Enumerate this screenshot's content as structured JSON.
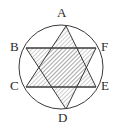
{
  "figure": {
    "background_color": "#ffffff",
    "stroke_color": "#3a3a3a",
    "hatch_color": "#8c8c8c",
    "label_color": "#2b2b2b",
    "circle": {
      "cx": 61,
      "cy": 67,
      "r": 42
    },
    "vertices": [
      {
        "id": "A",
        "label": "A",
        "x": 66,
        "y": 26,
        "label_x": 57,
        "label_y": 8,
        "position": "top"
      },
      {
        "id": "B",
        "label": "B",
        "x": 26,
        "y": 48,
        "label_x": 10,
        "label_y": 40,
        "position": "upper-left"
      },
      {
        "id": "F",
        "label": "F",
        "x": 96,
        "y": 48,
        "label_x": 101,
        "label_y": 40,
        "position": "upper-right"
      },
      {
        "id": "C",
        "label": "C",
        "x": 26,
        "y": 87,
        "label_x": 10,
        "label_y": 80,
        "position": "lower-left"
      },
      {
        "id": "E",
        "label": "E",
        "x": 96,
        "y": 87,
        "label_x": 101,
        "label_y": 80,
        "position": "lower-right"
      },
      {
        "id": "D",
        "label": "D",
        "x": 66,
        "y": 109,
        "label_x": 58,
        "label_y": 112,
        "position": "bottom"
      }
    ],
    "triangles": [
      {
        "id": "ACE",
        "points": "66,26 26,87 96,87",
        "label": "Triangle A C E"
      },
      {
        "id": "BDF",
        "points": "26,48 66,109 96,48",
        "label": "Triangle B D F"
      }
    ],
    "chords": [
      {
        "id": "BF",
        "from": "B",
        "to": "F",
        "x1": 26,
        "y1": 48,
        "x2": 96,
        "y2": 48
      },
      {
        "id": "CE",
        "from": "C",
        "to": "E",
        "x1": 26,
        "y1": 87,
        "x2": 96,
        "y2": 87
      }
    ],
    "hatch": {
      "pattern": "diagonal-lines",
      "angle_degrees": 45,
      "spacing_px": 3,
      "line_width_px": 0.9
    }
  }
}
